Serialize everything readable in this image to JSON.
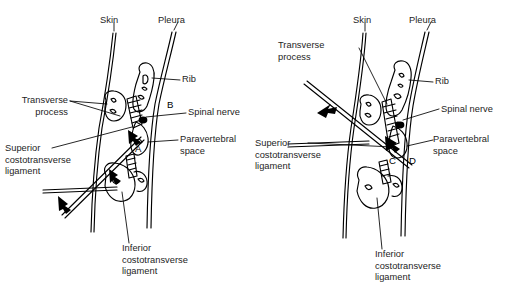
{
  "figure": {
    "background_color": "#ffffff",
    "ink_color": "#000000",
    "text_color": "#242424",
    "panel_count": 2
  },
  "panels": [
    {
      "id": "panel-left",
      "name": "left-panel",
      "markers": [
        {
          "letter": "A",
          "meaning": "needle tip position A"
        },
        {
          "letter": "B",
          "meaning": "needle tip position B"
        }
      ],
      "labels": {
        "skin": "Skin",
        "pleura": "Pleura",
        "rib": "Rib",
        "spinal_nerve": "Spinal nerve",
        "paravertebral_space": "Paravertebral\nspace",
        "transverse_process": "Transverse\nprocess",
        "superior_costotransverse_ligament": "Superior\ncostotransverse\nligament",
        "inferior_costotransverse_ligament": "Inferior\ncostotransverse\nligament"
      }
    },
    {
      "id": "panel-right",
      "name": "right-panel",
      "markers": [
        {
          "letter": "C",
          "meaning": "needle tip position C"
        },
        {
          "letter": "D",
          "meaning": "needle tip position D"
        }
      ],
      "labels": {
        "skin": "Skin",
        "pleura": "Pleura",
        "rib": "Rib",
        "spinal_nerve": "Spinal nerve",
        "paravertebral_space": "Paravertebral\nspace",
        "transverse_process": "Transverse\nprocess",
        "superior_costotransverse_ligament": "Superior\ncostotransverse\nligament",
        "inferior_costotransverse_ligament": "Inferior\ncostotransverse\nligament"
      }
    }
  ]
}
